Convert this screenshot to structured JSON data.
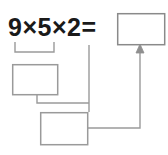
{
  "worksheet": {
    "expression": "9×5×2=",
    "operands": [
      9,
      5,
      2
    ],
    "operator": "×",
    "equals_sign": "=",
    "answer_box_value": "",
    "partial_product_box_value": "",
    "intermediate_box_value": "",
    "ink_color": "#1a1a1a",
    "line_color": "#9a9a9a",
    "box_fill": "#ffffff",
    "background": "#ffffff"
  },
  "boxes": [
    {
      "id": "answer-box",
      "label": "answer-box",
      "value": "",
      "x": 117,
      "y": 13,
      "width": 48,
      "height": 32
    },
    {
      "id": "partial-product-box",
      "label": "partial-product-box",
      "value": "",
      "x": 12,
      "y": 64,
      "width": 46,
      "height": 31
    },
    {
      "id": "intermediate-box",
      "label": "intermediate-box",
      "value": "",
      "x": 40,
      "y": 112,
      "width": 48,
      "height": 33
    }
  ],
  "connectors": [
    {
      "id": "grouping-bracket",
      "label": "bracket-under-9-times-5",
      "from": "9×5",
      "to": "partial-product-box"
    },
    {
      "id": "partial-to-intermediate",
      "label": "partial-product-box-to-intermediate-box"
    },
    {
      "id": "operand-2-drop",
      "label": "line-from-operand-2-to-intermediate-box"
    },
    {
      "id": "intermediate-to-answer",
      "label": "intermediate-box-to-answer-box-arrow",
      "arrowhead": true
    }
  ]
}
